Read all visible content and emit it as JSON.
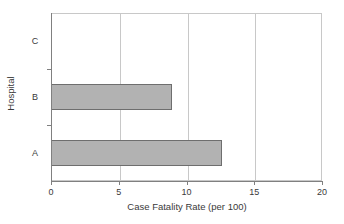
{
  "chart_data": {
    "type": "bar",
    "orientation": "horizontal",
    "title": "",
    "xlabel": "Case Fatality Rate (per 100)",
    "ylabel": "Hospital",
    "categories": [
      "A",
      "B",
      "C"
    ],
    "values": [
      12.6,
      8.9,
      0
    ],
    "xlim": [
      0,
      20
    ],
    "xticks": [
      0,
      5,
      10,
      15,
      20
    ],
    "xtick_labels": [
      "0",
      "5",
      "10",
      "15",
      "20"
    ],
    "grid": "vertical",
    "legend": "none",
    "bar_fill_color": "#b2b2b2",
    "bar_edge_color": "#6e6e6e",
    "gridline_color": "#c8c8c8",
    "axis_color": "#808080"
  }
}
